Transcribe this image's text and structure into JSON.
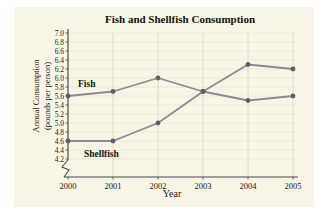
{
  "panel": {
    "background": "#f8f5e6"
  },
  "chart_data": {
    "type": "line",
    "title": "Fish and Shellfish Consumption",
    "xlabel": "Year",
    "ylabel_line1": "Annual Consumption",
    "ylabel_line2": "(pounds per person)",
    "categories": [
      2000,
      2001,
      2002,
      2003,
      2004,
      2005
    ],
    "series": [
      {
        "name": "Fish",
        "values": [
          5.6,
          5.7,
          6.0,
          5.7,
          5.5,
          5.6
        ]
      },
      {
        "name": "Shellfish",
        "values": [
          4.6,
          4.6,
          5.0,
          5.7,
          6.3,
          6.2
        ]
      }
    ],
    "ylim": [
      4.2,
      7.0
    ],
    "ytick_step": 0.2,
    "ytick_format_decimals": 1,
    "axis_break": true,
    "grid": true,
    "legend_position": "inline-labels",
    "colors": {
      "line": "#8b8b91",
      "marker": "#5f5f66",
      "axis": "#4a4a4a",
      "grid_vertical": "#dbd8c2",
      "grid_horizontal": "#eae7d4",
      "tick_text": "#1a1a1a"
    }
  }
}
